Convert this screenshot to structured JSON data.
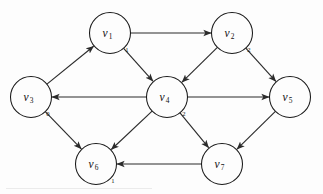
{
  "figure": {
    "kind": "directed-graph-diagram",
    "title": "",
    "background_color": "#fdfdfd",
    "stroke_color": "#2b2b2b",
    "node_fill": "#fdfdfd",
    "node_radius": 20.5
  },
  "nodes": [
    {
      "id": "v1",
      "name": "v",
      "subscript": "1",
      "x": 110,
      "y": 33,
      "weight": "1",
      "weight_x": 127,
      "weight_y": 49
    },
    {
      "id": "v2",
      "name": "v",
      "subscript": "2",
      "x": 232,
      "y": 33,
      "weight": "2",
      "weight_x": 249,
      "weight_y": 49
    },
    {
      "id": "v3",
      "name": "v",
      "subscript": "3",
      "x": 31,
      "y": 97,
      "weight": "0",
      "weight_x": 48,
      "weight_y": 113
    },
    {
      "id": "v4",
      "name": "v",
      "subscript": "4",
      "x": 167,
      "y": 97,
      "weight": "2",
      "weight_x": 184,
      "weight_y": 113
    },
    {
      "id": "v5",
      "name": "v",
      "subscript": "5",
      "x": 290,
      "y": 97,
      "weight": "",
      "weight_x": 0,
      "weight_y": 0
    },
    {
      "id": "v6",
      "name": "v",
      "subscript": "6",
      "x": 96,
      "y": 164,
      "weight": "1",
      "weight_x": 113,
      "weight_y": 180
    },
    {
      "id": "v7",
      "name": "v",
      "subscript": "7",
      "x": 222,
      "y": 164,
      "weight": "",
      "weight_x": 0,
      "weight_y": 0
    }
  ],
  "edges": [
    {
      "id": "e-v1-v2",
      "from": "v1",
      "to": "v2",
      "directed": true
    },
    {
      "id": "e-v1-v4",
      "from": "v1",
      "to": "v4",
      "directed": true
    },
    {
      "id": "e-v2-v4",
      "from": "v2",
      "to": "v4",
      "directed": true
    },
    {
      "id": "e-v2-v5",
      "from": "v2",
      "to": "v5",
      "directed": true
    },
    {
      "id": "e-v3-v1",
      "from": "v3",
      "to": "v1",
      "directed": true
    },
    {
      "id": "e-v3-v6",
      "from": "v3",
      "to": "v6",
      "directed": true
    },
    {
      "id": "e-v4-v3",
      "from": "v4",
      "to": "v3",
      "directed": true
    },
    {
      "id": "e-v4-v5",
      "from": "v4",
      "to": "v5",
      "directed": true
    },
    {
      "id": "e-v4-v6",
      "from": "v4",
      "to": "v6",
      "directed": true
    },
    {
      "id": "e-v4-v7",
      "from": "v4",
      "to": "v7",
      "directed": true
    },
    {
      "id": "e-v5-v7",
      "from": "v5",
      "to": "v7",
      "directed": true
    },
    {
      "id": "e-v7-v6",
      "from": "v7",
      "to": "v6",
      "directed": true
    }
  ]
}
